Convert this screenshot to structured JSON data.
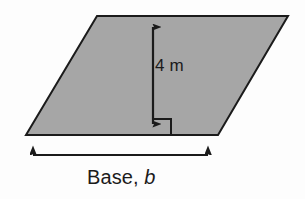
{
  "figure": {
    "name": "parallelogram-area-diagram",
    "shape": "parallelogram",
    "background_color": "#fdfdfd",
    "fill_color": "#a6a6a6",
    "stroke_color": "#1b1b1b",
    "labels": {
      "height": "4 m",
      "base_prefix": "Base,",
      "base_variable": "b"
    },
    "annotations": {
      "right_angle_marker": "right-angle-square",
      "height_arrow": "double-headed-vertical-arrow",
      "base_arrow": "double-headed-horizontal-arrow"
    },
    "geometry": {
      "top_left": [
        97,
        16
      ],
      "top_right": [
        288,
        16
      ],
      "bottom_right": [
        218,
        135
      ],
      "bottom_left": [
        26,
        135
      ],
      "height_arrow_x": 153,
      "height_arrow_top_y": 17,
      "height_arrow_bottom_y": 135,
      "base_arrow_y": 155,
      "base_arrow_left_x": 23,
      "base_arrow_right_x": 218
    }
  }
}
